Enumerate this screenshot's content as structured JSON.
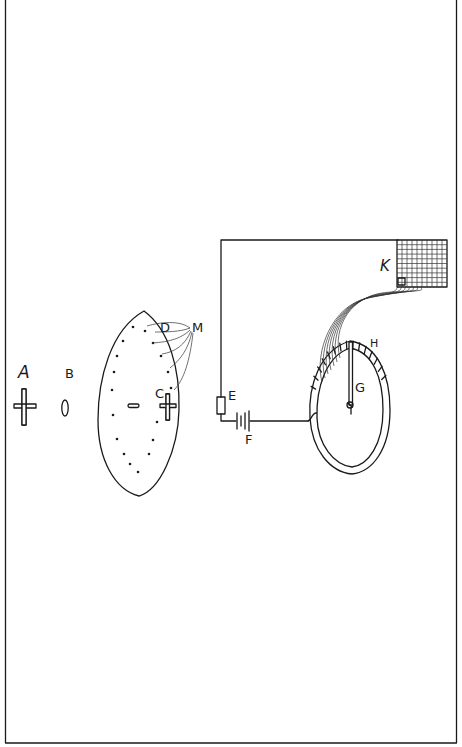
{
  "diagram": {
    "labels": {
      "A": "A",
      "B": "B",
      "C": "C",
      "D": "D",
      "M": "M",
      "E": "E",
      "F": "F",
      "G": "G",
      "H": "H",
      "K": "K"
    },
    "components": [
      {
        "id": "A",
        "description": "cross-shaped object"
      },
      {
        "id": "B",
        "description": "small lens"
      },
      {
        "id": "C",
        "description": "cross-shaped image on eye retina"
      },
      {
        "id": "D",
        "description": "receptor points on large eye"
      },
      {
        "id": "M",
        "description": "bundle of nerve fibres"
      },
      {
        "id": "E",
        "description": "resistor"
      },
      {
        "id": "F",
        "description": "battery"
      },
      {
        "id": "G",
        "description": "pointer / needle"
      },
      {
        "id": "H",
        "description": "segmented ring contacts"
      },
      {
        "id": "K",
        "description": "grid / receiving matrix"
      }
    ],
    "grid_cells": {
      "columns": 10,
      "rows": 10
    },
    "ring_segments": 14,
    "eye_dots": 20
  }
}
